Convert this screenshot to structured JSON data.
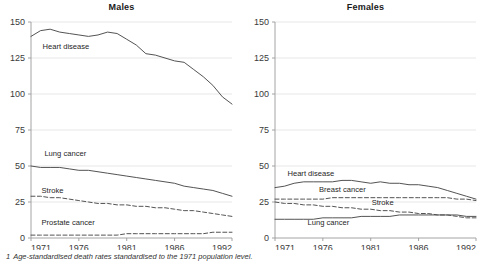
{
  "footnote": {
    "marker": "1",
    "text": "Age-standardised death rates standardised to the 1971 population level."
  },
  "axis": {
    "y_ticks": [
      "0",
      "25",
      "50",
      "75",
      "100",
      "125",
      "150"
    ],
    "x_ticks": [
      "1971",
      "1976",
      "1981",
      "1986",
      "1992"
    ]
  },
  "chart_data": [
    {
      "type": "line",
      "title": "Males",
      "xlabel": "",
      "ylabel": "",
      "xlim": [
        1971,
        1992
      ],
      "ylim": [
        0,
        150
      ],
      "grid": true,
      "legend": "inline-labels",
      "x": [
        1971,
        1972,
        1973,
        1974,
        1975,
        1976,
        1977,
        1978,
        1979,
        1980,
        1981,
        1982,
        1983,
        1984,
        1985,
        1986,
        1987,
        1988,
        1989,
        1990,
        1991,
        1992
      ],
      "series": [
        {
          "name": "Heart disease",
          "style": "solid",
          "label_x": 1972.2,
          "label_y": 131,
          "values": [
            140,
            144,
            145,
            143,
            142,
            141,
            140,
            141,
            143,
            142,
            138,
            134,
            128,
            127,
            125,
            123,
            122,
            117,
            112,
            106,
            98,
            93,
            85
          ]
        },
        {
          "name": "Lung cancer",
          "style": "solid",
          "label_x": 1972.4,
          "label_y": 57,
          "values": [
            50,
            49,
            49,
            49,
            48,
            47,
            47,
            46,
            45,
            44,
            43,
            42,
            41,
            40,
            39,
            38,
            36,
            35,
            34,
            33,
            31,
            29,
            27
          ]
        },
        {
          "name": "Stroke",
          "style": "dashed",
          "label_x": 1972.1,
          "label_y": 31,
          "values": [
            29,
            29,
            28,
            28,
            27,
            26,
            25,
            24,
            24,
            23,
            23,
            22,
            22,
            21,
            21,
            20,
            19,
            19,
            18,
            17,
            16,
            15,
            14
          ]
        },
        {
          "name": "Prostate cancer",
          "style": "dashed",
          "label_x": 1972.1,
          "label_y": 9,
          "values": [
            2,
            2,
            2,
            2,
            2,
            2,
            2,
            2,
            2,
            2,
            3,
            3,
            3,
            3,
            3,
            3,
            3,
            3,
            3,
            4,
            4,
            4,
            4
          ]
        }
      ]
    },
    {
      "type": "line",
      "title": "Females",
      "xlabel": "",
      "ylabel": "",
      "xlim": [
        1971,
        1992
      ],
      "ylim": [
        0,
        150
      ],
      "grid": true,
      "legend": "inline-labels",
      "x": [
        1971,
        1972,
        1973,
        1974,
        1975,
        1976,
        1977,
        1978,
        1979,
        1980,
        1981,
        1982,
        1983,
        1984,
        1985,
        1986,
        1987,
        1988,
        1989,
        1990,
        1991,
        1992
      ],
      "series": [
        {
          "name": "Heart disease",
          "style": "solid",
          "label_x": 1972.3,
          "label_y": 43,
          "values": [
            35,
            36,
            38,
            39,
            39,
            39,
            39,
            40,
            40,
            39,
            38,
            39,
            38,
            38,
            37,
            37,
            36,
            35,
            33,
            31,
            29,
            27,
            26
          ]
        },
        {
          "name": "Breast cancer",
          "style": "dashed",
          "label_x": 1975.6,
          "label_y": 32,
          "values": [
            27,
            27,
            27,
            27,
            27,
            27,
            28,
            28,
            28,
            28,
            28,
            28,
            28,
            28,
            28,
            28,
            28,
            28,
            28,
            27,
            27,
            26,
            26
          ]
        },
        {
          "name": "Stroke",
          "style": "dashed",
          "label_x": 1981.1,
          "label_y": 23,
          "values": [
            25,
            24,
            24,
            23,
            23,
            22,
            22,
            21,
            21,
            20,
            20,
            19,
            19,
            18,
            18,
            17,
            17,
            16,
            16,
            15,
            14,
            14,
            13
          ]
        },
        {
          "name": "Lung cancer",
          "style": "solid",
          "label_x": 1974.4,
          "label_y": 9,
          "values": [
            13,
            13,
            13,
            13,
            13,
            14,
            14,
            14,
            14,
            15,
            15,
            15,
            15,
            16,
            16,
            16,
            16,
            16,
            16,
            16,
            15,
            15,
            15
          ]
        }
      ]
    }
  ],
  "colors": {
    "line": "#4a4a4a",
    "grid": "#dcdcdc",
    "axis": "#9a9a9a",
    "text": "#2b2b2b"
  }
}
